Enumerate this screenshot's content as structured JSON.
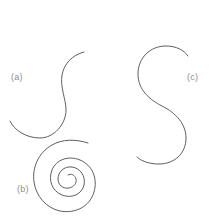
{
  "figure": {
    "background_color": "#ffffff",
    "stroke_color": "#5e5e5e",
    "label_color": "#8e8e8e",
    "width": 213,
    "height": 222,
    "panels": [
      {
        "id": "a",
        "label": "(a)",
        "shape": "s-curve-small",
        "label_position": "left",
        "description": "small S-shaped open curve"
      },
      {
        "id": "b",
        "label": "(b)",
        "shape": "spiral",
        "label_position": "bottom-left",
        "description": "archimedean spiral with about four turns"
      },
      {
        "id": "c",
        "label": "(c)",
        "shape": "s-curve-large",
        "label_position": "right",
        "description": "large S-shaped open curve"
      }
    ]
  },
  "chart_data": {
    "type": "line",
    "title": "",
    "xlabel": "",
    "ylabel": "",
    "xlim": [
      0,
      213
    ],
    "ylim": [
      0,
      222
    ],
    "grid": false,
    "legend": "none",
    "annotations": [
      {
        "text": "(a)",
        "x": 16,
        "y": 78
      },
      {
        "text": "(b)",
        "x": 23,
        "y": 190
      },
      {
        "text": "(c)",
        "x": 194,
        "y": 78
      }
    ],
    "series": [
      {
        "name": "(a) small S-curve",
        "path": "M 84 52 C 72 55 64 64 62 75 C 60 88 66 99 66 110 C 66 124 54 138 40 138 C 26 138 14 130 10 121"
      },
      {
        "name": "(b) spiral",
        "path": "M 88 143 C 76 139 62 139 52 145 C 38 153 32 168 34 182 C 36 196 46 208 60 211 C 76 214 90 206 94 192 C 98 178 92 165 80 160 C 68 155 56 160 52 170 C 48 180 52 191 62 195 C 72 199 82 194 84 185 C 86 176 80 168 72 167 C 64 166 58 172 58 179 C 58 185 63 189 69 188 C 74 187 77 183 76 179 C 75 175 71 173 68 175"
      },
      {
        "name": "(c) large S-curve",
        "path": "M 188 56 C 184 50 176 46 166 46 C 150 46 138 58 138 74 C 138 90 150 100 162 106 C 176 113 186 124 186 138 C 186 154 174 164 159 164 C 149 164 141 161 137 157"
      }
    ]
  }
}
